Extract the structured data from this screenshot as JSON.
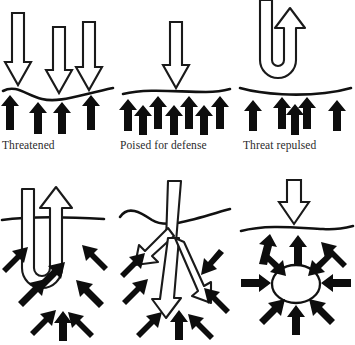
{
  "figure": {
    "colors": {
      "threat_outline": "#1a1a1a",
      "threat_fill": "#ffffff",
      "defense_arrow": "#0d0d0d",
      "boundary_line": "#111111",
      "background": "#ffffff",
      "label_text": "#2b2b2b"
    },
    "layout": {
      "rows": 2,
      "columns": 3,
      "panel_width_px": 118,
      "panel_height_px": 172
    }
  },
  "panels": [
    {
      "id": "threatened",
      "row": 1,
      "column": 1,
      "label": "Threatened",
      "threat_arrows": 3,
      "threat_direction": "down",
      "defense_arrows": 4,
      "defense_direction": "up",
      "boundary": "wavy",
      "breached": false
    },
    {
      "id": "poised-for-defense",
      "row": 1,
      "column": 2,
      "label": "Poised for defense",
      "threat_arrows": 1,
      "threat_direction": "down",
      "defense_arrows": 7,
      "defense_direction": "up",
      "boundary": "wavy",
      "breached": false
    },
    {
      "id": "threat-repulsed",
      "row": 1,
      "column": 3,
      "label": "Threat repulsed",
      "threat_arrows": 1,
      "threat_direction": "u-turn-up",
      "defense_arrows": 5,
      "defense_direction": "up",
      "boundary": "wavy",
      "breached": false
    },
    {
      "id": "threat-penetrates",
      "row": 2,
      "column": 1,
      "label": "",
      "threat_arrows": 1,
      "threat_direction": "u-turn-penetrating",
      "defense_arrows": 8,
      "defense_direction": "converging",
      "boundary": "straight",
      "breached": true
    },
    {
      "id": "threat-disseminates",
      "row": 2,
      "column": 2,
      "label": "",
      "threat_arrows": 3,
      "threat_direction": "branching-down",
      "defense_arrows": 8,
      "defense_direction": "converging",
      "boundary": "wavy",
      "breached": true
    },
    {
      "id": "threat-encapsulated",
      "row": 2,
      "column": 3,
      "label": "",
      "threat_arrows": 1,
      "threat_direction": "down",
      "defense_arrows": 11,
      "defense_direction": "converging-on-oval",
      "boundary": "wavy",
      "breached": true,
      "encapsulated_shape": "oval"
    }
  ],
  "labels": {
    "panel_1": "Threatened",
    "panel_2": "Poised for defense",
    "panel_3": "Threat repulsed"
  }
}
